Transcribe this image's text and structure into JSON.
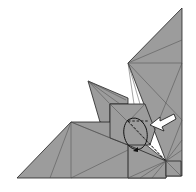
{
  "diagram": {
    "type": "origami-fold-diagram",
    "colors": {
      "paper": "#9b9b9b",
      "paper_light": "#a8a8a8",
      "edge": "#222222",
      "crease": "#555555",
      "arrow_fill": "#ffffff",
      "background": "#ffffff"
    },
    "elements": {
      "push_arrow": "white push/sink arrow pointing left into model",
      "fold_arrow": "curved black arrow with valley-fold dashed lines",
      "valley_fold": "dashed diagonal line"
    }
  }
}
